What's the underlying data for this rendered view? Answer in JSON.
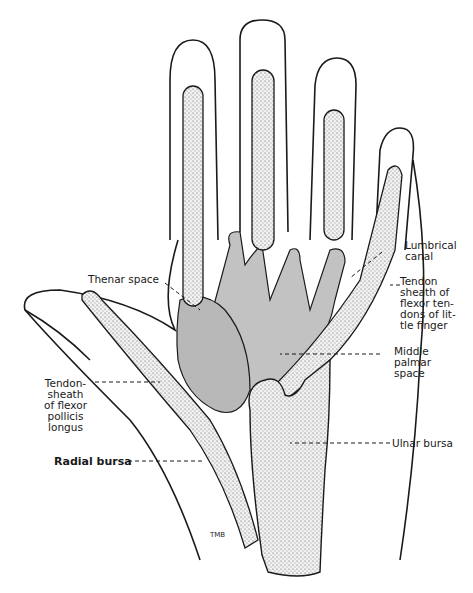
{
  "diagram": {
    "colors": {
      "outline": "#1a1a1a",
      "tendon_sheath_fill": "#d9d9d9",
      "space_fill": "#bdbdbd",
      "background": "#ffffff"
    },
    "labels": {
      "lumbrical_canal": "Lumbrical\ncanal",
      "tendon_sheath_little_finger": "Tendon\nsheath of\nflexor ten-\ndons of lit-\ntle finger",
      "middle_palmar_space": "Middle\npalmar\nspace",
      "thenar_space": "Thenar space",
      "tendon_sheath_fpl": "Tendon-\nsheath\nof flexor\npollicis\nlongus",
      "radial_bursa": "Radial bursa",
      "ulnar_bursa": "Ulnar bursa"
    },
    "signature": "TMB"
  }
}
